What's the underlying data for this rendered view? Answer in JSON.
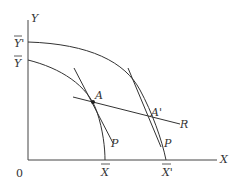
{
  "diagram": {
    "title": "",
    "axes": {
      "x_label": "X",
      "y_label": "Y",
      "origin_label": "0"
    },
    "y_intercepts": {
      "outer": "Y'",
      "inner": "Y"
    },
    "x_intercepts": {
      "inner": "X",
      "outer": "X'"
    },
    "points": {
      "A": "A",
      "A_prime": "A'"
    },
    "lines": {
      "price_line_A": "P",
      "price_line_A_prime": "P",
      "ray": "R"
    },
    "colors": {
      "ink": "#333333",
      "background": "#ffffff"
    }
  }
}
